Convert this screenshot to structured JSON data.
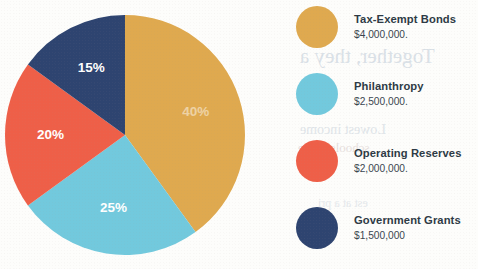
{
  "chart_data": {
    "type": "pie",
    "title": "",
    "categories": [
      "Tax-Exempt Bonds",
      "Philanthropy",
      "Operating Reserves",
      "Government Grants"
    ],
    "values": [
      40,
      25,
      20,
      15
    ],
    "value_unit": "percent",
    "amounts": [
      "$4,000,000.",
      "$2,500,000.",
      "$2,000,000.",
      "$1,500,000"
    ],
    "amounts_numeric": [
      4000000,
      2500000,
      2000000,
      1500000
    ],
    "slice_labels": [
      "40%",
      "25%",
      "20%",
      "15%"
    ],
    "colors": [
      "#dfa94f",
      "#72c9dd",
      "#ee5f48",
      "#2e4470"
    ],
    "legend_position": "right",
    "start_angle_deg": 0,
    "direction": "clockwise",
    "grid": false
  },
  "pie": {
    "slices": [
      {
        "label": "40%",
        "percent": 40,
        "color": "#dfa94f",
        "label_faded": true
      },
      {
        "label": "25%",
        "percent": 25,
        "color": "#72c9dd",
        "label_faded": false
      },
      {
        "label": "20%",
        "percent": 20,
        "color": "#ee5f48",
        "label_faded": false
      },
      {
        "label": "15%",
        "percent": 15,
        "color": "#2e4470",
        "label_faded": false
      }
    ]
  },
  "legend": {
    "items": [
      {
        "label": "Tax-Exempt Bonds",
        "amount": "$4,000,000.",
        "color": "#dfa94f",
        "swatch_icon": "circle-swatch-icon"
      },
      {
        "label": "Philanthropy",
        "amount": "$2,500,000.",
        "color": "#72c9dd",
        "swatch_icon": "circle-swatch-icon"
      },
      {
        "label": "Operating Reserves",
        "amount": "$2,000,000.",
        "color": "#ee5f48",
        "swatch_icon": "circle-swatch-icon"
      },
      {
        "label": "Government Grants",
        "amount": "$1,500,000",
        "color": "#2e4470",
        "swatch_icon": "circle-swatch-icon"
      }
    ]
  },
  "artifacts": {
    "bleed_through": [
      "Together, they a",
      "rank",
      "Lowest income",
      "schools in the",
      "est at a pri"
    ]
  }
}
